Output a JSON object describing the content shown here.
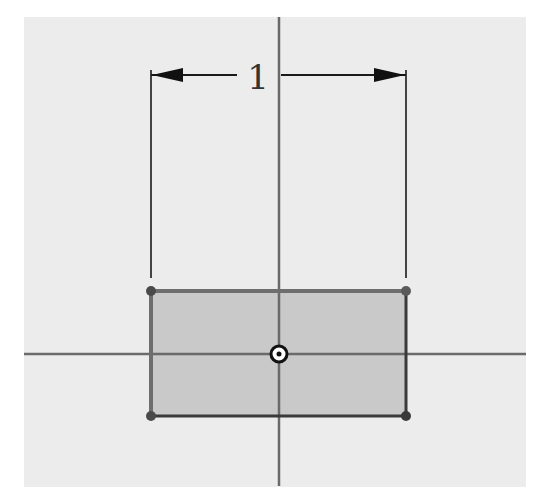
{
  "sketch": {
    "dimension_value": "1",
    "colors": {
      "background": "#ececec",
      "axis": "#6a6a6a",
      "rect_fill": "#c9c9c9",
      "rect_edge": "#5a5a5a",
      "dimension": "#1a1a1a",
      "vertex": "#4a4a4a"
    },
    "rectangle": {
      "x1": 151,
      "y1": 291,
      "x2": 406,
      "y2": 416
    },
    "origin": {
      "x": 279,
      "y": 354
    },
    "elements": [
      "horizontal-axis",
      "vertical-axis",
      "rectangle",
      "dimension-width",
      "origin-point",
      "vertex-points"
    ]
  }
}
